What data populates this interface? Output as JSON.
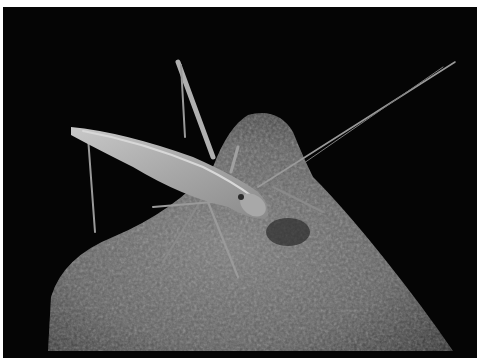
{
  "image": {
    "alt": "Grayscale night photograph of a long-legged katydid with very long antennae perched on a speckled rock against a black background",
    "subject": "katydid",
    "surface": "rock",
    "colors": {
      "background": "#050505",
      "border": "#ffffff",
      "rock_dark": "#3a3a3a",
      "rock_mid": "#6a6a6a",
      "rock_light": "#9a9a9a",
      "insect_body": "#b8b8b8",
      "insect_highlight": "#d8d8d8"
    }
  }
}
